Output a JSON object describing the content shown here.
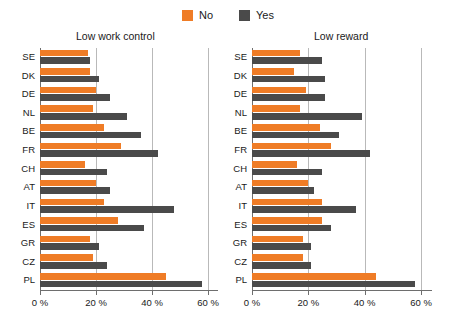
{
  "legend": {
    "entries": [
      {
        "label": "No",
        "color": "#ef7c26"
      },
      {
        "label": "Yes",
        "color": "#4a4a4a"
      }
    ]
  },
  "axis": {
    "ticks": [
      "0 %",
      "20 %",
      "40 %",
      "60 %"
    ],
    "tick_values": [
      0,
      20,
      40,
      60
    ]
  },
  "chart_data": [
    {
      "type": "bar",
      "orientation": "horizontal",
      "title": "Low work control",
      "xlabel": "",
      "ylabel": "",
      "xlim": [
        0,
        60
      ],
      "xticks": [
        0,
        20,
        40,
        60
      ],
      "xticklabels": [
        "0 %",
        "20 %",
        "40 %",
        "60 %"
      ],
      "grid": true,
      "legend_position": "top-center",
      "categories": [
        "SE",
        "DK",
        "DE",
        "NL",
        "BE",
        "FR",
        "CH",
        "AT",
        "IT",
        "ES",
        "GR",
        "CZ",
        "PL"
      ],
      "series": [
        {
          "name": "No",
          "color": "#ef7c26",
          "values": [
            17,
            18,
            20,
            19,
            23,
            29,
            16,
            20,
            23,
            28,
            18,
            19,
            45
          ]
        },
        {
          "name": "Yes",
          "color": "#4a4a4a",
          "values": [
            18,
            21,
            25,
            31,
            36,
            42,
            24,
            25,
            48,
            37,
            21,
            24,
            58
          ]
        }
      ]
    },
    {
      "type": "bar",
      "orientation": "horizontal",
      "title": "Low reward",
      "xlabel": "",
      "ylabel": "",
      "xlim": [
        0,
        60
      ],
      "xticks": [
        0,
        20,
        40,
        60
      ],
      "xticklabels": [
        "0 %",
        "20 %",
        "40 %",
        "60 %"
      ],
      "grid": true,
      "legend_position": "top-center",
      "categories": [
        "SE",
        "DK",
        "DE",
        "NL",
        "BE",
        "FR",
        "CH",
        "AT",
        "IT",
        "ES",
        "GR",
        "CZ",
        "PL"
      ],
      "series": [
        {
          "name": "No",
          "color": "#ef7c26",
          "values": [
            17,
            15,
            19,
            17,
            24,
            28,
            16,
            20,
            25,
            25,
            18,
            18,
            44
          ]
        },
        {
          "name": "Yes",
          "color": "#4a4a4a",
          "values": [
            25,
            26,
            26,
            39,
            31,
            42,
            25,
            22,
            37,
            28,
            21,
            21,
            58
          ]
        }
      ]
    }
  ]
}
